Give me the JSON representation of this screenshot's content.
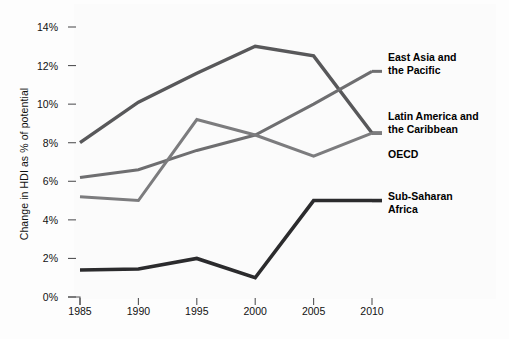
{
  "chart_data": {
    "type": "line",
    "title": "",
    "xlabel": "",
    "ylabel": "Change in HDI as % of potential",
    "categories": [
      "1985",
      "1990",
      "1995",
      "2000",
      "2005",
      "2010"
    ],
    "x": [
      1985,
      1990,
      1995,
      2000,
      2005,
      2010
    ],
    "ylim": [
      0,
      14
    ],
    "xlim": [
      1985,
      2010
    ],
    "grid": false,
    "legend_position": "right-inline",
    "ytick_labels": [
      "0%",
      "2%",
      "4%",
      "6%",
      "8%",
      "10%",
      "12%",
      "14%"
    ],
    "ytick_values": [
      0,
      2,
      4,
      6,
      8,
      10,
      12,
      14
    ],
    "series": [
      {
        "name": "East Asia and the Pacific",
        "label": "East Asia and\nthe Pacific",
        "color": "#58585a",
        "width": 3.4,
        "values": [
          8.0,
          10.1,
          11.6,
          13.0,
          12.5,
          8.5
        ],
        "label_x": 388,
        "label_y": 51
      },
      {
        "name": "Latin America and the Caribbean",
        "label": "Latin America and\nthe Caribbean",
        "color": "#6e6e70",
        "width": 3.0,
        "values": [
          6.2,
          6.6,
          7.6,
          8.4,
          10.0,
          11.7
        ],
        "label_x": 388,
        "label_y": 110
      },
      {
        "name": "OECD",
        "label": "OECD",
        "color": "#7c7c7e",
        "width": 3.0,
        "values": [
          5.2,
          5.0,
          9.2,
          8.4,
          7.3,
          8.5
        ],
        "label_x": 388,
        "label_y": 148
      },
      {
        "name": "Sub-Saharan Africa",
        "label": "Sub-Saharan\nAfrica",
        "color": "#2b2b2d",
        "width": 3.6,
        "values": [
          1.4,
          1.45,
          2.0,
          1.0,
          5.0,
          5.0
        ],
        "label_x": 388,
        "label_y": 190
      }
    ]
  },
  "axis": {
    "tick_color": "#555557",
    "label_color": "#111111"
  },
  "background": {
    "page": "#fdfdfd",
    "plot": "#fbfbfb"
  }
}
